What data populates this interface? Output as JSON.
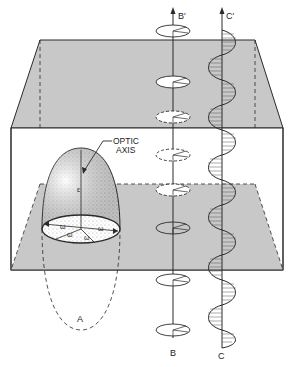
{
  "figure": {
    "labels": {
      "optic_axis_line1": "OPTIC",
      "optic_axis_line2": "AXIS",
      "epsilon": "ε",
      "omega": "ω",
      "a": "A",
      "b": "B",
      "b_prime": "B′",
      "c": "C",
      "c_prime": "C′"
    },
    "colors": {
      "plane_gray": "#c8c8c8",
      "line": "#2a2a2a",
      "background": "#ffffff"
    },
    "components": [
      "indicatrix-ellipsoid",
      "circular-polarization-axis-B",
      "linear-polarization-wave-C",
      "crystal-box"
    ]
  }
}
